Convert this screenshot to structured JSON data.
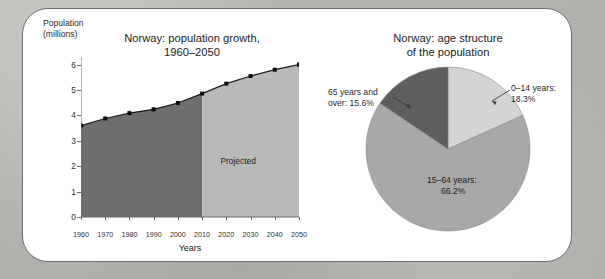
{
  "figure": {
    "background_color": "#b4b2ae",
    "panel_color": "#ffffff",
    "panel_border_color": "#6f6f6f"
  },
  "chart_data": [
    {
      "type": "area",
      "title": "Norway: population growth,\n1960–2050",
      "title_line1": "Norway: population growth,",
      "title_line2": "1960–2050",
      "xlabel": "Years",
      "ylabel": "Population\n(millions)",
      "ylabel_line1": "Population",
      "ylabel_line2": "(millions)",
      "x": [
        1960,
        1970,
        1980,
        1990,
        2000,
        2010,
        2020,
        2030,
        2040,
        2050
      ],
      "values": [
        3.6,
        3.88,
        4.09,
        4.24,
        4.49,
        4.86,
        5.25,
        5.55,
        5.8,
        6.0
      ],
      "xticks": [
        "1960",
        "1970",
        "1980",
        "1990",
        "2000",
        "2010",
        "2020",
        "2030",
        "2040",
        "2050"
      ],
      "yticks": [
        "0",
        "1",
        "2",
        "3",
        "4",
        "5",
        "6"
      ],
      "ylim": [
        0,
        6.3
      ],
      "xlim": [
        1960,
        2050
      ],
      "grid": false,
      "legend": "none",
      "annotation": "Projected",
      "annotation_x": 2025,
      "split_year": 2010,
      "series_colors": {
        "historical_fill": "#6e6e6e",
        "projected_fill": "#b9b9b9",
        "line": "#1a1a1a",
        "marker": "#0d0d0d"
      }
    },
    {
      "type": "pie",
      "title": "Norway: age structure\nof the population",
      "title_line1": "Norway: age structure",
      "title_line2": "of the population",
      "categories": [
        "0–14 years",
        "15–64 years",
        "65 years and over"
      ],
      "values": [
        18.3,
        66.2,
        15.6
      ],
      "labels": [
        "0–14 years:\n18.3%",
        "15–64 years:\n66.2%",
        "65 years and\nover: 15.6%"
      ],
      "slices": [
        {
          "name": "0–14 years",
          "percent": 18.3,
          "percent_text": "18.3%",
          "label_line1": "0–14 years:",
          "label_line2": "18.3%",
          "color": "#d4d4d4"
        },
        {
          "name": "15–64 years",
          "percent": 66.2,
          "percent_text": "66.2%",
          "label_line1": "15–64 years:",
          "label_line2": "66.2%",
          "color": "#a8a8a8"
        },
        {
          "name": "65 years and over",
          "percent": 15.6,
          "percent_text": "15.6%",
          "label_line1": "65 years and",
          "label_line2": "over: 15.6%",
          "color": "#5e5e5e"
        }
      ],
      "start_angle_deg": 0,
      "direction": "clockwise",
      "legend": "none"
    }
  ]
}
